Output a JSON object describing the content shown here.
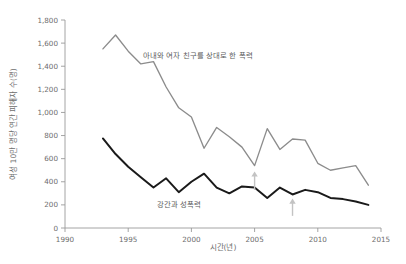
{
  "chart_data": {
    "type": "line",
    "title": "",
    "xlabel": "시간(년)",
    "ylabel": "여성 10만 명당 연간 피해자 수(명)",
    "xlim": [
      1990,
      2015
    ],
    "ylim": [
      0,
      1800
    ],
    "grid": false,
    "legend_position": "inline-annotation",
    "x_ticks": [
      1990,
      1995,
      2000,
      2005,
      2010,
      2015
    ],
    "x_tick_labels": [
      "1990",
      "1995",
      "2000",
      "2005",
      "2010",
      "2015"
    ],
    "y_ticks": [
      0,
      200,
      400,
      600,
      800,
      1000,
      1200,
      1400,
      1600,
      1800
    ],
    "y_tick_labels": [
      "0",
      "200",
      "400",
      "600",
      "800",
      "1,000",
      "1,200",
      "1,400",
      "1,600",
      "1,800"
    ],
    "x": [
      1993,
      1994,
      1995,
      1996,
      1997,
      1998,
      1999,
      2000,
      2001,
      2002,
      2003,
      2004,
      2005,
      2006,
      2007,
      2008,
      2009,
      2010,
      2011,
      2012,
      2013,
      2014
    ],
    "series": [
      {
        "name": "아내와 여자 친구를 상대로 한 폭력",
        "color": "#8c8c8c",
        "values": [
          1550,
          1670,
          1530,
          1420,
          1440,
          1220,
          1040,
          960,
          690,
          870,
          790,
          700,
          540,
          860,
          680,
          770,
          760,
          560,
          500,
          520,
          540,
          370
        ]
      },
      {
        "name": "강간과 성폭력",
        "color": "#1a1a1a",
        "values": [
          775,
          640,
          530,
          440,
          350,
          430,
          310,
          400,
          470,
          350,
          300,
          360,
          350,
          260,
          350,
          290,
          330,
          310,
          260,
          250,
          230,
          200
        ]
      }
    ],
    "annotations": [
      {
        "label": "아내와 여자 친구를 상대로 한 폭력",
        "kind": "series-label",
        "x": 2000.5,
        "y": 1470
      },
      {
        "label": "강간과 성폭력",
        "kind": "series-label",
        "x": 1999.0,
        "y": 185
      },
      {
        "label": "",
        "kind": "up-arrow",
        "x": 2005.0,
        "y_from": 330,
        "y_to": 490
      },
      {
        "label": "",
        "kind": "up-arrow",
        "x": 2008.0,
        "y_from": 105,
        "y_to": 255
      }
    ]
  },
  "colors": {
    "background": "#ffffff",
    "axis": "#9a9a9a",
    "tick_text": "#6d6d6d",
    "series_gray": "#8c8c8c",
    "series_black": "#1a1a1a",
    "arrow": "#c3c3c3"
  }
}
